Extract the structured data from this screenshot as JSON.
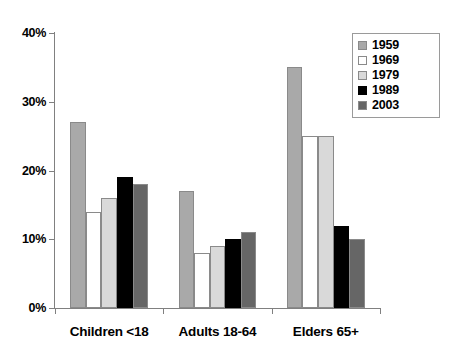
{
  "chart_data": {
    "type": "bar",
    "title": "",
    "xlabel": "",
    "ylabel": "",
    "categories": [
      "Children <18",
      "Adults 18-64",
      "Elders 65+"
    ],
    "series": [
      {
        "name": "1959",
        "color": "#a9a9a9",
        "values": [
          27,
          17,
          35
        ]
      },
      {
        "name": "1969",
        "color": "#ffffff",
        "values": [
          14,
          8,
          25
        ]
      },
      {
        "name": "1979",
        "color": "#d9d9d9",
        "values": [
          16,
          9,
          25
        ]
      },
      {
        "name": "1989",
        "color": "#000000",
        "values": [
          19,
          10,
          12
        ]
      },
      {
        "name": "2003",
        "color": "#666666",
        "values": [
          18,
          11,
          10
        ]
      }
    ],
    "ylim": [
      0,
      40
    ],
    "ytick_values": [
      0,
      10,
      20,
      30,
      40
    ],
    "ytick_labels": [
      "0%",
      "10%",
      "20%",
      "30%",
      "40%"
    ],
    "grid": false,
    "legend_position": "top-right"
  },
  "axes": {
    "y_ticks": [
      "0%",
      "10%",
      "20%",
      "30%",
      "40%"
    ],
    "x_categories": [
      "Children <18",
      "Adults 18-64",
      "Elders 65+"
    ]
  },
  "legend": {
    "entries": [
      {
        "label": "1959"
      },
      {
        "label": "1969"
      },
      {
        "label": "1979"
      },
      {
        "label": "1989"
      },
      {
        "label": "2003"
      }
    ]
  }
}
